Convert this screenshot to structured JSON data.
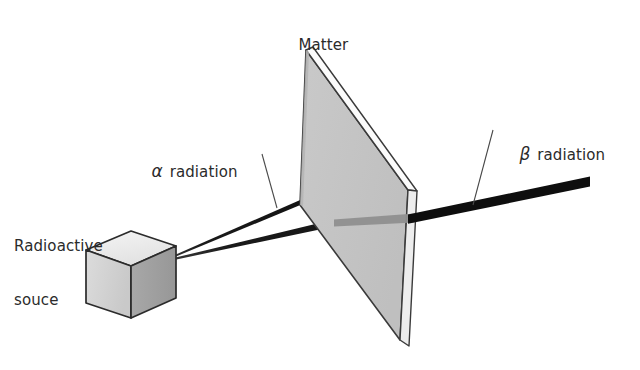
{
  "figure": {
    "background_color": "#ffffff"
  },
  "labels": {
    "matter": "Matter",
    "source_line1": "Radioactive",
    "source_line2": "souce",
    "alpha_symbol": "α",
    "alpha_text": " radiation",
    "beta_symbol": "β",
    "beta_text": " radiation"
  },
  "colors": {
    "outline": "#2b2b2b",
    "text": "#2b2b2b",
    "slab_face": "#c4c4c4",
    "slab_edge_highlight": "#f7f7f7",
    "slab_edge_side": "#8e8e8e",
    "cube_top": "#ececec",
    "cube_front": "#d2d2d2",
    "cube_side": "#9e9e9e",
    "ray": "#111111",
    "ray_behind_slab": "#8a8a8a",
    "leader": "#4a4a4a"
  },
  "elements": {
    "source_cube": {
      "name": "radioactive-source-cube",
      "description": "Grey isometric cube representing the radioactive source"
    },
    "matter_slab": {
      "name": "matter-slab",
      "description": "Grey plate of matter shown in perspective that absorbs alpha radiation"
    },
    "alpha_ray": {
      "name": "alpha-ray",
      "description": "Upper black ray that stops inside the matter slab"
    },
    "beta_ray": {
      "name": "beta-ray",
      "description": "Lower black ray that passes through the slab and continues to the right, thickening"
    }
  },
  "geometry": {
    "cube": {
      "top_face": "86,250 131,231 176,246 131,266",
      "front_face": "86,250 131,266 131,318 86,303",
      "side_face": "131,266 176,246 176,298 131,318",
      "emission_point": [
        166,
        259
      ]
    },
    "slab": {
      "face": "306,50 408,190 400,340 300,205",
      "right_band": "408,190 415,196 407,345 400,340",
      "top_band": "306,50 312,48 415,191 408,190"
    },
    "alpha_ray": {
      "start": [
        167,
        259
      ],
      "end": [
        352,
        180
      ],
      "start_width": 1.2,
      "end_width": 6.5
    },
    "beta_ray": {
      "start": [
        167,
        260
      ],
      "through_slab": [
        332,
        222
      ],
      "exit": [
        415,
        218
      ],
      "end": [
        590,
        180
      ],
      "start_width": 1.2,
      "end_width": 9
    },
    "alpha_leader": "262,155 276,207",
    "beta_leader": "492,131 473,204"
  }
}
